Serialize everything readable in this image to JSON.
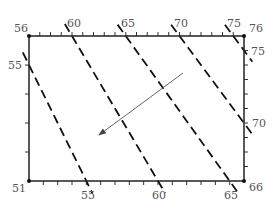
{
  "diagram": {
    "type": "contour-map-with-gradient-arrow",
    "frame": {
      "x0": 29,
      "y0": 36,
      "x1": 244,
      "y1": 181
    },
    "corner_labels": {
      "top_left": "56",
      "top_right": "76",
      "bottom_left": "51",
      "bottom_right": "66"
    },
    "edges": {
      "top": {
        "from": 56,
        "to": 76,
        "labels": [
          "60",
          "65",
          "70",
          "75"
        ]
      },
      "bottom": {
        "from": 51,
        "to": 66,
        "labels": [
          "55",
          "60",
          "65"
        ]
      },
      "left": {
        "from": 56,
        "to": 51,
        "labels": [
          "55"
        ]
      },
      "right": {
        "from": 76,
        "to": 66,
        "labels": [
          "75",
          "70"
        ]
      }
    },
    "contours": [
      {
        "value": 55,
        "from": "left:55",
        "to": "bottom:55"
      },
      {
        "value": 60,
        "from": "top:60",
        "to": "bottom:60"
      },
      {
        "value": 65,
        "from": "top:65",
        "to": "bottom:65"
      },
      {
        "value": 70,
        "from": "top:70",
        "to": "right:70"
      },
      {
        "value": 75,
        "from": "top:75",
        "to": "right:75"
      }
    ],
    "arrow": {
      "tail": [
        183,
        73
      ],
      "head": [
        99,
        135
      ],
      "direction": "down-left"
    },
    "colors": {
      "frame": "#222222",
      "contour": "#111111",
      "arrow": "#666666",
      "label": "#555555"
    }
  }
}
